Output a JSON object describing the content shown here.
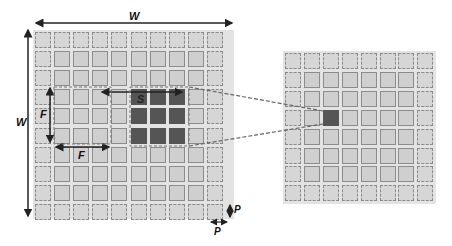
{
  "diagram": {
    "labels": {
      "width_top": "W",
      "width_left": "W",
      "filter_vertical": "F",
      "filter_horizontal": "F",
      "stride": "S",
      "padding_vertical": "P",
      "padding_horizontal": "P"
    },
    "input_grid": {
      "cells_per_side": 10,
      "padding": 1,
      "filter_size": 3,
      "highlight_rows": [
        3,
        4,
        5
      ],
      "highlight_cols": [
        5,
        6,
        7
      ]
    },
    "output_grid": {
      "cells_per_side": 8,
      "padding": 1,
      "highlight_row": 3,
      "highlight_col": 2
    },
    "colors": {
      "background": "#ffffff",
      "grid_bg": "#e3e3e3",
      "cell": "#cfcfcf",
      "filter_cell": "#555555",
      "arrows": "#222222",
      "dashed": "#777777"
    }
  }
}
